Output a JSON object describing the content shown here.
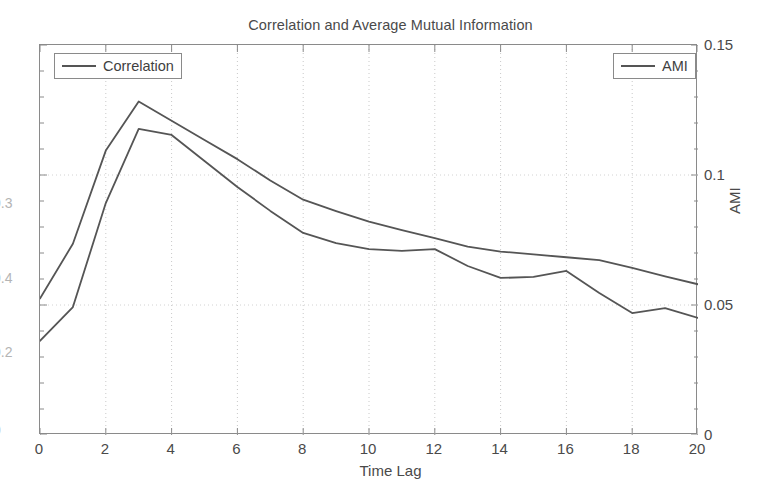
{
  "chart_data": {
    "type": "line",
    "title": "Correlation and Average Mutual Information",
    "xlabel": "Time Lag",
    "ylabel": "",
    "ylabel_right": "AMI",
    "grid": true,
    "grid_style": "dotted",
    "legend_position": "top-left and top-right",
    "xlim": [
      0,
      20
    ],
    "ylim_right": [
      0,
      0.15
    ],
    "x": [
      0,
      1,
      2,
      3,
      4,
      5,
      6,
      7,
      8,
      9,
      10,
      11,
      12,
      13,
      14,
      15,
      16,
      17,
      18,
      19,
      20
    ],
    "xticks": [
      "0",
      "2",
      "4",
      "6",
      "8",
      "10",
      "12",
      "14",
      "16",
      "18",
      "20"
    ],
    "xtick_values": [
      0,
      2,
      4,
      6,
      8,
      10,
      12,
      14,
      16,
      18,
      20
    ],
    "yticks_left": [
      "0",
      "0.2",
      "0.4",
      "0.3"
    ],
    "ytick_left_labels_clipped": true,
    "yticks_right": [
      "0",
      "0.05",
      "0.1",
      "0.15"
    ],
    "ytick_right_values": [
      0,
      0.05,
      0.1,
      0.15
    ],
    "series": [
      {
        "name": "AMI",
        "axis": "right",
        "color": "#555555",
        "values": [
          0.0362,
          0.0492,
          0.0892,
          0.1177,
          0.1154,
          0.1054,
          0.0954,
          0.0862,
          0.0777,
          0.0738,
          0.0715,
          0.0708,
          0.0715,
          0.065,
          0.0604,
          0.0608,
          0.0631,
          0.0546,
          0.0469,
          0.0488,
          0.045
        ]
      },
      {
        "name": "Correlation",
        "axis": "left",
        "color": "#555555",
        "values": [
          0.0192,
          0.0269,
          0.04,
          0.0469,
          0.0442,
          0.0415,
          0.0388,
          0.0358,
          0.0331,
          0.0315,
          0.03,
          0.0288,
          0.0277,
          0.0265,
          0.0258,
          0.0254,
          0.025,
          0.0246,
          0.0235,
          0.0223,
          0.0212
        ]
      }
    ]
  },
  "legend": {
    "correlation_label": "Correlation",
    "ami_label": "AMI"
  }
}
